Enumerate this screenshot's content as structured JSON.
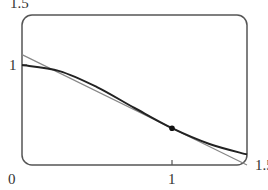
{
  "chart_data": {
    "type": "line",
    "title": "",
    "xlabel": "",
    "ylabel": "",
    "xlim": [
      0,
      1.5
    ],
    "ylim": [
      0,
      1.5
    ],
    "x_ticks": [
      "0",
      "1",
      "1.5"
    ],
    "y_ticks": [
      "1",
      "1.5"
    ],
    "grid": false,
    "series": [
      {
        "name": "curve y = e^(-x^2)",
        "x": [
          0,
          0.25,
          0.5,
          0.75,
          1.0,
          1.25,
          1.5
        ],
        "y": [
          1.0,
          0.939,
          0.779,
          0.57,
          0.368,
          0.21,
          0.105
        ],
        "color": "#222222"
      },
      {
        "name": "tangent line at x=1",
        "x": [
          0,
          1.5
        ],
        "y": [
          1.104,
          0.0
        ],
        "color": "#888888"
      }
    ],
    "annotations": [
      {
        "type": "point",
        "x": 1.0,
        "y": 0.368
      }
    ]
  },
  "labels": {
    "origin": "0",
    "x_one": "1",
    "x_max": "1.5",
    "y_one": "1",
    "y_max": "1.5"
  }
}
